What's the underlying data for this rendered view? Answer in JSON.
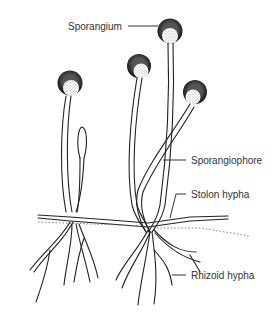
{
  "diagram": {
    "labels": {
      "sporangium": "Sporangium",
      "sporangiophore": "Sporangiophore",
      "stolon": "Stolon hypha",
      "rhizoid": "Rhizoid hypha"
    },
    "colors": {
      "line": "#222222",
      "text": "#333333",
      "sporangium_dark": "#1a1a1a",
      "background": "#ffffff"
    }
  }
}
